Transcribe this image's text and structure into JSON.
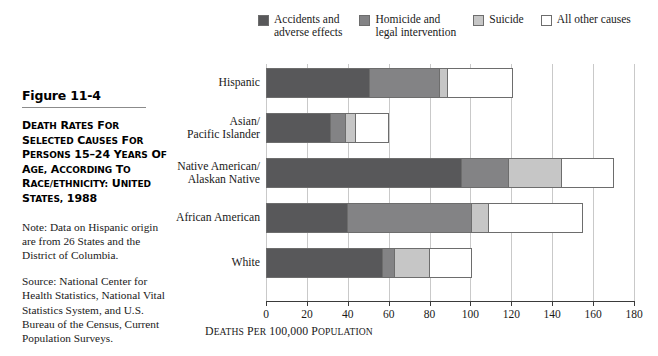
{
  "figure": {
    "number": "Figure 11-4",
    "title_lines": [
      "DEATH RATES FOR",
      "SELECTED CAUSES FOR",
      "PERSONS 15–24 YEARS OF",
      "AGE, ACCORDING TO",
      "RACE/ETHNICITY: UNITED",
      "STATES, 1988"
    ],
    "note": "Note: Data on Hispanic origin are from 26 States and the District of Columbia.",
    "source": "Source: National Center for Health Statistics, National Vital Statistics System, and U.S. Bureau of the Census, Current Population Surveys."
  },
  "legend": {
    "items": [
      {
        "label": "Accidents and\nadverse effects",
        "color": "#58585a"
      },
      {
        "label": "Homicide and\nlegal intervention",
        "color": "#838385"
      },
      {
        "label": "Suicide",
        "color": "#c6c6c6"
      },
      {
        "label": "All other causes",
        "color": "#ffffff"
      }
    ]
  },
  "chart_data": {
    "type": "bar",
    "orientation": "horizontal",
    "stacked": true,
    "xlabel": "DEATHS PER 100,000 POPULATION",
    "ylabel": "",
    "xlim": [
      0,
      180
    ],
    "xticks": [
      0,
      20,
      40,
      60,
      80,
      100,
      120,
      140,
      160,
      180
    ],
    "xtick_labels": [
      "0",
      "20",
      "40",
      "60",
      "80",
      "100",
      "120",
      "140",
      "160",
      "180"
    ],
    "grid": true,
    "grid_axis": "x",
    "legend_position": "top",
    "categories": [
      "Hispanic",
      "Asian/\nPacific Islander",
      "Native American/\nAlaskan Native",
      "African American",
      "White"
    ],
    "series": [
      {
        "name": "Accidents and adverse effects",
        "color": "#58585a",
        "values": [
          51,
          32,
          96,
          40,
          57
        ]
      },
      {
        "name": "Homicide and legal intervention",
        "color": "#838385",
        "values": [
          34,
          7,
          23,
          61,
          6
        ]
      },
      {
        "name": "Suicide",
        "color": "#c6c6c6",
        "values": [
          4,
          5,
          26,
          8,
          17
        ]
      },
      {
        "name": "All other causes",
        "color": "#ffffff",
        "values": [
          32,
          16,
          25,
          46,
          21
        ]
      }
    ],
    "totals": [
      121,
      60,
      170,
      155,
      101
    ]
  }
}
